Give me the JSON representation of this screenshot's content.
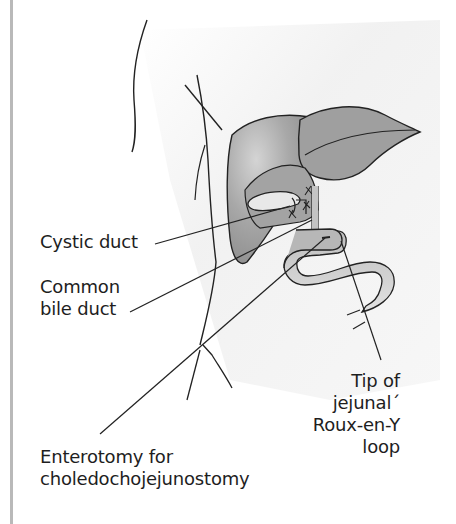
{
  "figure": {
    "labels": {
      "cystic_duct": "Cystic duct",
      "common_bile_duct": [
        "Common",
        "bile duct"
      ],
      "enterotomy": [
        "Enterotomy for",
        "choledochojejunostomy"
      ],
      "tip_of_loop": [
        "Tip of",
        "jejunal´",
        "Roux-en-Y",
        "loop"
      ]
    },
    "structures": [
      "body-outline",
      "liver-right-lobe",
      "liver-left-lobe",
      "gallbladder",
      "common-bile-duct",
      "roux-en-y-jejunal-loop",
      "enterotomy-site"
    ],
    "colors": {
      "liver": "#9a9a9a",
      "liver_light": "#c8c8c8",
      "gallbladder": "#e6e6e6",
      "bowel": "#cfcfcf",
      "outline": "#222222",
      "background_shade": "#f1f1f1",
      "rule": "#b9b9b9"
    }
  }
}
